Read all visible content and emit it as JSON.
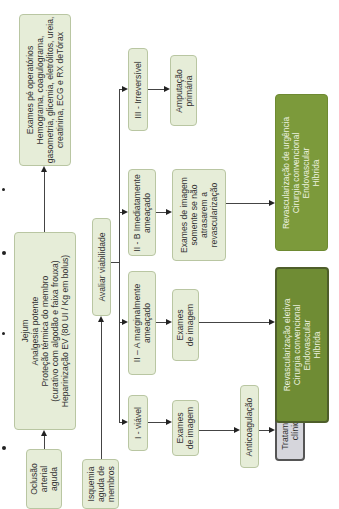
{
  "diagram": {
    "orientation": "rotated-90-ccw",
    "nodes": {
      "exames_pre": "Exames pé operatórios\nHemograma, coagulograma,\ngasometria, glicemia, eletrólitos, ureia,\ncreatinina, ECG e RX deTórax",
      "jejum": "Jejum\nAnalgesia potente\nProteção térmica do membro\n(curativo com algodão e faixa frouxa)\nHeparinização EV (80 UI / Kg em bolus)",
      "oclusao": "Oclusão\narterial\naguda",
      "isquemia": "Isquemia\naguda de\nmembros",
      "avaliar": "Avaliar viabilidade",
      "iii": "III - Irreversível",
      "iib": "II - B Imediatamente\nameaçado",
      "iia": "II – A marginalmente\nameaçado",
      "i": "I - viável",
      "amputacao": "Amputação\nprimária",
      "exames_iib": "Exames de imagem\nsomente se não\natrasarem a\nrevascularização",
      "exames_iia": "Exames\nde imagem",
      "exames_i": "Exames\nde imagem",
      "anticoagulacao": "Anticoagulação",
      "tratamento": "Tratamento\nclínico",
      "revasc_urgencia": "Revascularização de urgência\nCirurgia convencional\nEndovascular\nHíbrida",
      "revasc_eletiva": "Revascularização eletiva\nCirurgia convencional\nEndovascular\nHíbrida"
    },
    "colors": {
      "light_box": "#e6edd8",
      "dark_box": "#7c9a3b",
      "gray_box": "#d6d6dc",
      "line": "#444444"
    }
  }
}
